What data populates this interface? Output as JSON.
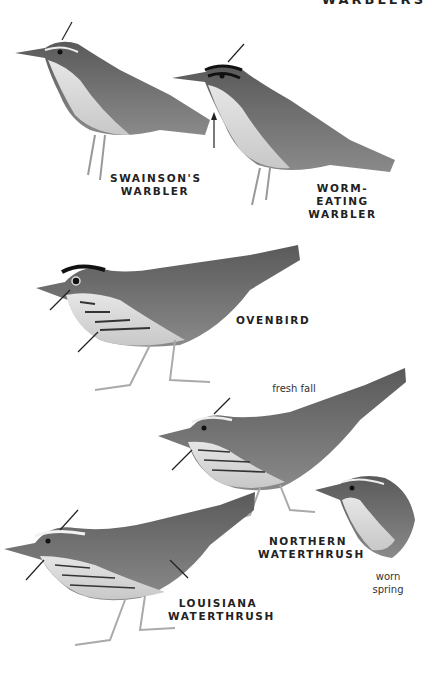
{
  "page": {
    "header": "WARBLERS"
  },
  "species": [
    {
      "id": "swainsons",
      "name_line1": "SWAINSON'S",
      "name_line2": "WARBLER"
    },
    {
      "id": "worm-eating",
      "name_line1": "WORM-EATING",
      "name_line2": "WARBLER"
    },
    {
      "id": "ovenbird",
      "name_line1": "OVENBIRD",
      "name_line2": ""
    },
    {
      "id": "northern-waterthrush",
      "name_line1": "NORTHERN",
      "name_line2": "WATERTHRUSH"
    },
    {
      "id": "louisiana-waterthrush",
      "name_line1": "LOUISIANA",
      "name_line2": "WATERTHRUSH"
    }
  ],
  "notes": {
    "fresh_fall": "fresh fall",
    "worn_line1": "worn",
    "worn_line2": "spring"
  },
  "colors": {
    "ink": "#222222",
    "bird_dark": "#4a4a4a",
    "bird_mid": "#7a7a7a",
    "bird_light": "#d8d8d8"
  }
}
